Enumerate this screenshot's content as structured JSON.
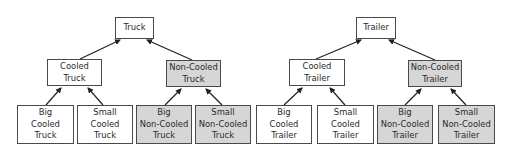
{
  "colors": {
    "white_fill": "#ffffff",
    "gray_fill": "#d6d6d6",
    "border": "#4a4a4a",
    "arrow": "#222222"
  },
  "trees": [
    {
      "root": {
        "label": "Truck",
        "fill": "white"
      },
      "children": [
        {
          "label": "Cooled\nTruck",
          "fill": "white",
          "children": [
            {
              "label": "Big\nCooled\nTruck",
              "fill": "white"
            },
            {
              "label": "Small\nCooled\nTruck",
              "fill": "white"
            }
          ]
        },
        {
          "label": "Non-Cooled\nTruck",
          "fill": "gray",
          "children": [
            {
              "label": "Big\nNon-Cooled\nTruck",
              "fill": "gray"
            },
            {
              "label": "Small\nNon-Cooled\nTruck",
              "fill": "gray"
            }
          ]
        }
      ]
    },
    {
      "root": {
        "label": "Trailer",
        "fill": "white"
      },
      "children": [
        {
          "label": "Cooled\nTrailer",
          "fill": "white",
          "children": [
            {
              "label": "Big\nCooled\nTrailer",
              "fill": "white"
            },
            {
              "label": "Small\nCooled\nTrailer",
              "fill": "white"
            }
          ]
        },
        {
          "label": "Non-Cooled\nTrailer",
          "fill": "gray",
          "children": [
            {
              "label": "Big\nNon-Cooled\nTrailer",
              "fill": "gray"
            },
            {
              "label": "Small\nNon-Cooled\nTrailer",
              "fill": "gray"
            }
          ]
        }
      ]
    }
  ]
}
